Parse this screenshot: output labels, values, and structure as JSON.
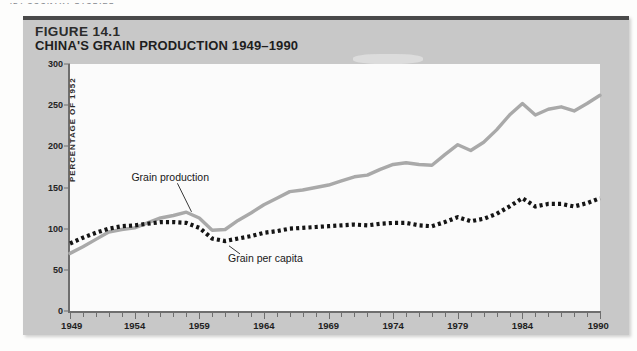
{
  "running_head": "424  COUNTRY  STUDIES",
  "figure": {
    "number_prefix": "F",
    "number_rest": "IGURE",
    "number_value": "14.1",
    "number_full": "FIGURE 14.1",
    "title": "CHINA'S GRAIN PRODUCTION 1949–1990"
  },
  "colors": {
    "panel_bg": "#c8c8c8",
    "panel_rule": "#4a4a4a",
    "plot_bg": "#fbfbfb",
    "axis": "#6e6e6e",
    "production_line": "#a9a9a9",
    "per_capita_line": "#151515",
    "page_bg": "#fdfdfc"
  },
  "chart_data": {
    "type": "line",
    "title": "CHINA'S GRAIN PRODUCTION 1949–1990",
    "xlabel": "",
    "ylabel": "PERCENTAGE OF 1952",
    "xlim": [
      1949,
      1990
    ],
    "ylim": [
      0,
      300
    ],
    "yticks": [
      0,
      50,
      100,
      150,
      200,
      250,
      300
    ],
    "xticks": [
      1949,
      1954,
      1959,
      1964,
      1969,
      1974,
      1979,
      1984,
      1990
    ],
    "xtick_minor_interval": 1,
    "grid": false,
    "legend": "inline-annotations",
    "annotations": [
      {
        "text": "Grain production",
        "series": "Grain production",
        "x": 1957,
        "y": 160
      },
      {
        "text": "Grain per capita",
        "series": "Grain per capita",
        "x": 1962,
        "y": 62
      }
    ],
    "x": [
      1949,
      1950,
      1951,
      1952,
      1953,
      1954,
      1955,
      1956,
      1957,
      1958,
      1959,
      1960,
      1961,
      1962,
      1963,
      1964,
      1965,
      1966,
      1967,
      1968,
      1969,
      1970,
      1971,
      1972,
      1973,
      1974,
      1975,
      1976,
      1977,
      1978,
      1979,
      1980,
      1981,
      1982,
      1983,
      1984,
      1985,
      1986,
      1987,
      1988,
      1989,
      1990
    ],
    "series": [
      {
        "name": "Grain production",
        "style": "solid",
        "color": "#a9a9a9",
        "values": [
          70,
          78,
          87,
          96,
          99,
          101,
          107,
          113,
          116,
          120,
          113,
          98,
          99,
          110,
          119,
          129,
          137,
          145,
          147,
          150,
          153,
          158,
          163,
          165,
          172,
          178,
          180,
          178,
          177,
          190,
          202,
          195,
          205,
          220,
          238,
          252,
          238,
          245,
          248,
          243,
          252,
          262
        ]
      },
      {
        "name": "Grain per capita",
        "style": "dotted",
        "color": "#151515",
        "values": [
          82,
          89,
          95,
          100,
          103,
          104,
          106,
          108,
          108,
          107,
          101,
          88,
          85,
          88,
          91,
          95,
          97,
          100,
          101,
          102,
          103,
          104,
          105,
          104,
          106,
          107,
          107,
          104,
          103,
          108,
          114,
          109,
          112,
          118,
          127,
          137,
          127,
          130,
          130,
          127,
          131,
          137
        ]
      }
    ]
  }
}
